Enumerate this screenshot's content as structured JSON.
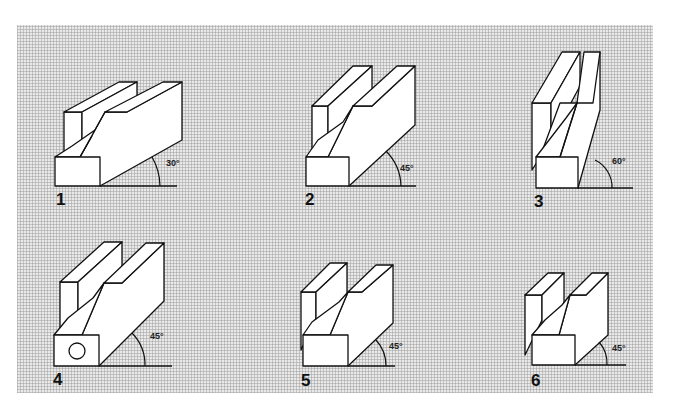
{
  "diagram": {
    "colors": {
      "background_grid": "#e9e9e9",
      "grid_lines": "#969696",
      "stroke": "#111111",
      "face": "#ffffff"
    },
    "figures": [
      {
        "number": "1",
        "angle": "30°"
      },
      {
        "number": "2",
        "angle": "45°"
      },
      {
        "number": "3",
        "angle": "60°"
      },
      {
        "number": "4",
        "angle": "45°",
        "feature": "circular hole in front face"
      },
      {
        "number": "5",
        "angle": "45°"
      },
      {
        "number": "6",
        "angle": "45°"
      }
    ]
  }
}
